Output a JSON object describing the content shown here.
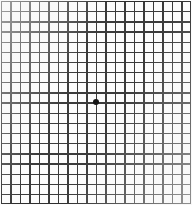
{
  "chart_data": {
    "type": "grid",
    "columns": 20,
    "rows": 20,
    "cell_width_px": 9.5,
    "cell_height_px": 10.15,
    "grid_origin_x_px": 1,
    "grid_origin_y_px": 1,
    "grid_width_px": 190,
    "grid_height_px": 203,
    "line_width_px": 1.3,
    "line_color": "#3a3a3a",
    "frame_line_width_px": 1.6,
    "frame_color": "#2e2e2e",
    "background_color": "#fcfcfc",
    "fixation_dot": {
      "label": "central fixation dot",
      "center_x_px": 96,
      "center_y_px": 102,
      "diameter_px": 6,
      "color": "#141414"
    },
    "xlabel": "",
    "ylabel": "",
    "grid": true,
    "legend": false,
    "annotations": []
  }
}
